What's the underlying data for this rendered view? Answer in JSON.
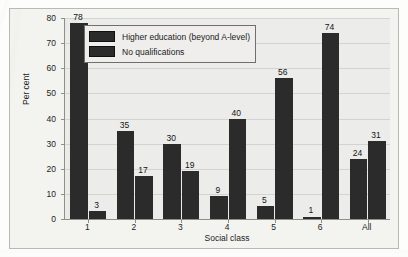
{
  "chart_data": {
    "type": "bar",
    "title": "",
    "subtitle": "",
    "xlabel": "Social class",
    "ylabel": "Per cent",
    "categories": [
      "1",
      "2",
      "3",
      "4",
      "5",
      "6",
      "All"
    ],
    "series": [
      {
        "name": "Higher education (beyond A-level)",
        "values": [
          78,
          35,
          30,
          9,
          5,
          1,
          24
        ],
        "color": "#2b2b2b"
      },
      {
        "name": "No qualifications",
        "values": [
          3,
          17,
          19,
          40,
          56,
          74,
          31
        ],
        "color": "#2b2b2b"
      }
    ],
    "ylim": [
      0,
      80
    ],
    "yticks": [
      0,
      10,
      20,
      30,
      40,
      50,
      60,
      70,
      80
    ],
    "ytick_labels": [
      "0",
      "10",
      "20",
      "30",
      "40",
      "50",
      "60",
      "70",
      "80"
    ],
    "grid": true,
    "grid_axis": "y",
    "legend_position": "top-center",
    "data_labels": true
  },
  "legend": {
    "entries": [
      {
        "label": "Higher education (beyond A-level)",
        "swatch": "#2b2b2b"
      },
      {
        "label": "No qualifications",
        "swatch": "#2b2b2b"
      }
    ]
  },
  "colors": {
    "bar": "#2b2b2b",
    "plot_background": "#ececeb",
    "figure_background": "#f3f3f0",
    "axis_line": "#8e8e8a",
    "gridline": "#d3d3d0",
    "text": "#1d1d1d"
  }
}
